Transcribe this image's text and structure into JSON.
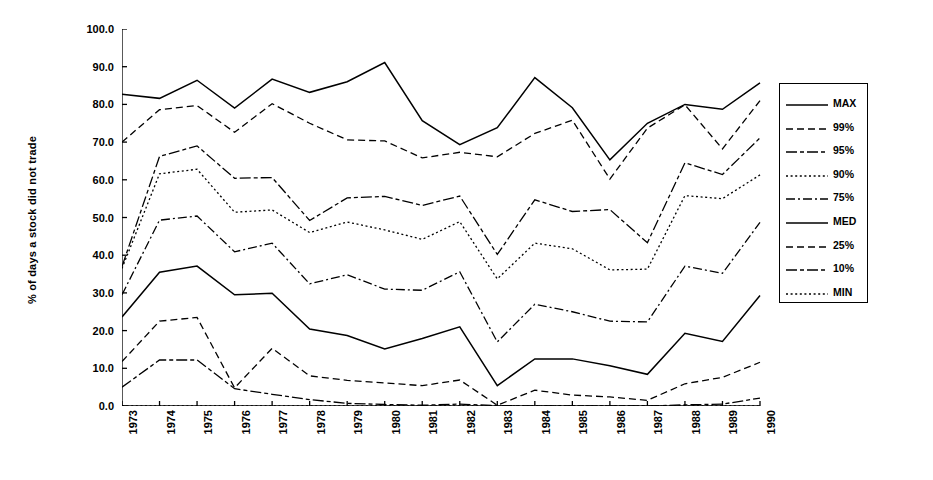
{
  "chart_data": {
    "type": "line",
    "title": "",
    "xlabel": "",
    "ylabel": "% of days a stock did not trade",
    "xlim": [
      1973,
      1990
    ],
    "ylim": [
      0,
      100
    ],
    "grid": false,
    "legend_position": "right",
    "x": [
      1973,
      1974,
      1975,
      1976,
      1977,
      1978,
      1979,
      1980,
      1981,
      1982,
      1983,
      1984,
      1985,
      1986,
      1987,
      1988,
      1989,
      1990
    ],
    "categories": [
      "1973",
      "1974",
      "1975",
      "1976",
      "1977",
      "1978",
      "1979",
      "1980",
      "1981",
      "1982",
      "1983",
      "1984",
      "1985",
      "1986",
      "1987",
      "1988",
      "1989",
      "1990"
    ],
    "ytick_labels": [
      "0.0",
      "10.0",
      "20.0",
      "30.0",
      "40.0",
      "50.0",
      "60.0",
      "70.0",
      "80.0",
      "90.0",
      "100.0"
    ],
    "ytick_values": [
      0,
      10,
      20,
      30,
      40,
      50,
      60,
      70,
      80,
      90,
      100
    ],
    "series": [
      {
        "name": "MAX",
        "dash": "solid",
        "values": [
          82.7,
          81.6,
          86.4,
          79.0,
          86.7,
          83.2,
          86.0,
          91.1,
          75.7,
          69.3,
          73.8,
          87.1,
          79.1,
          65.3,
          75.0,
          80.0,
          78.7,
          85.7
        ]
      },
      {
        "name": "99%",
        "dash": "dashed",
        "values": [
          70.0,
          78.6,
          79.7,
          72.6,
          80.2,
          75.0,
          70.6,
          70.3,
          65.8,
          67.3,
          66.1,
          72.3,
          75.8,
          60.2,
          73.7,
          79.9,
          68.2,
          81.0
        ]
      },
      {
        "name": "95%",
        "dash": "longdash",
        "values": [
          37.0,
          66.2,
          69.0,
          60.4,
          60.6,
          49.2,
          55.2,
          55.6,
          53.2,
          55.7,
          40.2,
          54.7,
          51.6,
          52.1,
          43.3,
          64.5,
          61.4,
          71.1
        ]
      },
      {
        "name": "90%",
        "dash": "dotted",
        "values": [
          36.5,
          61.6,
          62.8,
          51.4,
          52.0,
          46.0,
          48.8,
          46.7,
          44.2,
          48.9,
          33.7,
          43.2,
          41.7,
          36.1,
          36.3,
          55.8,
          55.0,
          61.3
        ]
      },
      {
        "name": "75%",
        "dash": "dashdot",
        "values": [
          29.5,
          49.3,
          50.4,
          40.9,
          43.2,
          32.4,
          34.8,
          31.0,
          30.7,
          35.6,
          17.0,
          27.0,
          25.0,
          22.5,
          22.3,
          37.1,
          35.2,
          48.7
        ]
      },
      {
        "name": "MED",
        "dash": "solid",
        "values": [
          23.6,
          35.5,
          37.1,
          29.5,
          29.9,
          20.4,
          18.7,
          15.1,
          17.9,
          21.0,
          5.4,
          12.5,
          12.5,
          10.7,
          8.4,
          19.3,
          17.1,
          29.3
        ]
      },
      {
        "name": "25%",
        "dash": "dashed",
        "values": [
          11.8,
          22.5,
          23.5,
          4.8,
          15.3,
          8.0,
          6.8,
          6.1,
          5.4,
          6.9,
          0.2,
          4.2,
          2.9,
          2.4,
          1.5,
          5.9,
          7.6,
          11.6
        ]
      },
      {
        "name": "10%",
        "dash": "longdash",
        "values": [
          5.0,
          12.2,
          12.2,
          4.6,
          3.1,
          1.7,
          0.7,
          0.4,
          0.2,
          0.5,
          0.1,
          0.0,
          0.0,
          0.0,
          0.0,
          0.3,
          0.5,
          2.1
        ]
      },
      {
        "name": "MIN",
        "dash": "dotted",
        "values": [
          0.0,
          0.0,
          0.0,
          0.0,
          0.0,
          0.0,
          0.0,
          0.0,
          0.0,
          0.0,
          0.0,
          0.0,
          0.0,
          0.0,
          0.0,
          0.0,
          0.0,
          0.0
        ]
      }
    ]
  },
  "legend": {
    "items": [
      {
        "label": "MAX"
      },
      {
        "label": "99%"
      },
      {
        "label": "95%"
      },
      {
        "label": "90%"
      },
      {
        "label": "75%"
      },
      {
        "label": "MED"
      },
      {
        "label": "25%"
      },
      {
        "label": "10%"
      },
      {
        "label": "MIN"
      }
    ]
  },
  "colors": {
    "line": "#000000",
    "background": "#ffffff"
  }
}
